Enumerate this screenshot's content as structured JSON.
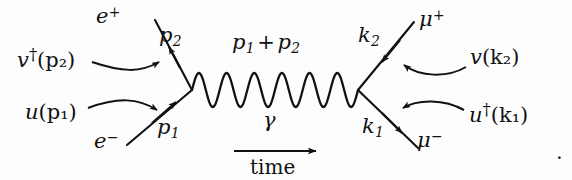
{
  "figure": {
    "kind": "feynman-diagram",
    "process": "e+ e- -> mu+ mu-",
    "background_color": "#fdfdfd",
    "ink_color": "#111111",
    "width": 572,
    "height": 180
  },
  "labels": {
    "incoming_positron_spinor": {
      "base": "v",
      "dagger": "†",
      "arg": "(p₂)"
    },
    "incoming_electron_spinor": {
      "base": "u",
      "arg": "(p₁)"
    },
    "positron_particle": {
      "base": "e",
      "charge": "+"
    },
    "electron_particle": {
      "base": "e",
      "charge": "−"
    },
    "positron_momentum": {
      "base": "p",
      "index": "2"
    },
    "electron_momentum": {
      "base": "p",
      "index": "1"
    },
    "photon_momentum": {
      "left": "p",
      "left_index": "1",
      "operator": "+",
      "right": "p",
      "right_index": "2"
    },
    "photon_particle": "γ",
    "time_axis": "time",
    "antimuon_momentum": {
      "base": "k",
      "index": "2"
    },
    "muon_momentum": {
      "base": "k",
      "index": "1"
    },
    "antimuon_particle": {
      "base": "μ",
      "charge": "+"
    },
    "muon_particle": {
      "base": "μ",
      "charge": "−"
    },
    "outgoing_antimuon_spinor": {
      "base": "v",
      "arg": "(k₂)"
    },
    "outgoing_muon_spinor": {
      "base": "u",
      "dagger": "†",
      "arg": "(k₁)"
    },
    "trailing_punctuation": "."
  },
  "geometry": {
    "left_vertex": {
      "x": 192,
      "y": 90
    },
    "right_vertex": {
      "x": 358,
      "y": 90
    },
    "photon_wave_cycles": 6,
    "photon_amplitude": 17,
    "time_arrow": {
      "x1": 234,
      "x2": 320,
      "y": 151
    }
  }
}
